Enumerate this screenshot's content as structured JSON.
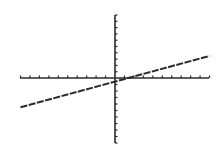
{
  "chart_data": {
    "type": "line",
    "title": "",
    "xlabel": "",
    "ylabel": "",
    "xlim": [
      -10,
      10
    ],
    "ylim": [
      -10,
      10
    ],
    "xscl": 1,
    "yscl": 1,
    "grid": false,
    "legend": null,
    "series": [
      {
        "name": "y = 0.4x - 0.5",
        "x": [
          -10,
          10
        ],
        "values": [
          -4.5,
          3.5
        ]
      }
    ]
  },
  "style": {
    "line_color": "#2b2b2b",
    "axis_color": "#2b2b2b",
    "background": "#ffffff"
  },
  "layout": {
    "x_axis_px": {
      "left": 20,
      "right": 209,
      "y": 78
    },
    "y_axis_px": {
      "x": 115,
      "top": 15,
      "bottom": 143
    }
  }
}
